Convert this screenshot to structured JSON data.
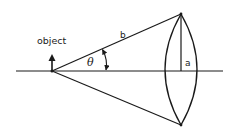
{
  "diagram": {
    "labels": {
      "object": "object",
      "hypotenuse": "b",
      "half_aperture": "a",
      "angle": "θ"
    },
    "colors": {
      "line": "#1a1a1a",
      "background": "#ffffff"
    },
    "elements": [
      {
        "name": "optical-axis",
        "type": "line"
      },
      {
        "name": "object-arrow",
        "type": "arrow"
      },
      {
        "name": "upper-ray",
        "type": "line",
        "label": "b"
      },
      {
        "name": "lower-ray",
        "type": "line"
      },
      {
        "name": "lens",
        "type": "biconvex-lens"
      },
      {
        "name": "lens-half-height",
        "type": "line",
        "label": "a"
      },
      {
        "name": "angle-arc",
        "type": "double-arrow-arc",
        "label": "θ"
      }
    ]
  }
}
